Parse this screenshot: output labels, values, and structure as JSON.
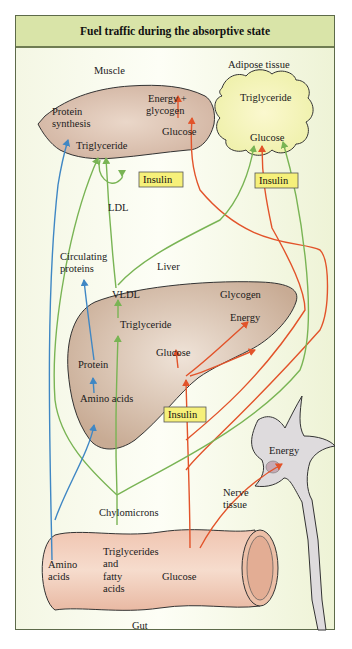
{
  "title": "Fuel traffic during the absorptive state",
  "colors": {
    "frame_background": "#f4f7e4",
    "title_band": "#d9e4a8",
    "organ_fill": "#dcc4b2",
    "adipose_fill": "#f6f4c4",
    "gut_fill": "#f1cbb8",
    "nerve_fill": "#dedbdd",
    "glucose_arrow": "#e2532a",
    "lipid_arrow": "#79b454",
    "amino_arrow": "#3f87c4",
    "insulin_box": "#f6f07a"
  },
  "organs": {
    "muscle": {
      "name": "Muscle",
      "labels": [
        "Energy +",
        "glycogen",
        "Protein",
        "synthesis",
        "Glucose",
        "Triglyceride"
      ]
    },
    "adipose": {
      "name": "Adipose tissue",
      "labels": [
        "Triglyceride",
        "Glucose"
      ]
    },
    "liver": {
      "name": "Liver",
      "labels": [
        "VLDL",
        "Glycogen",
        "Energy",
        "Triglyceride",
        "Glucose",
        "Protein",
        "Amino acids"
      ]
    },
    "nerve": {
      "name_lines": [
        "Nerve",
        "tissue"
      ],
      "labels": [
        "Energy"
      ]
    },
    "gut": {
      "name": "Gut",
      "labels": {
        "amino": [
          "Amino",
          "acids"
        ],
        "lipids": [
          "Triglycerides",
          "and",
          "fatty",
          "acids"
        ],
        "glucose": "Glucose"
      }
    }
  },
  "free_labels": {
    "ldl": "LDL",
    "circulating_proteins": [
      "Circulating",
      "proteins"
    ],
    "chylomicrons": "Chylomicrons"
  },
  "insulin_labels": [
    "Insulin",
    "Insulin",
    "Insulin"
  ]
}
